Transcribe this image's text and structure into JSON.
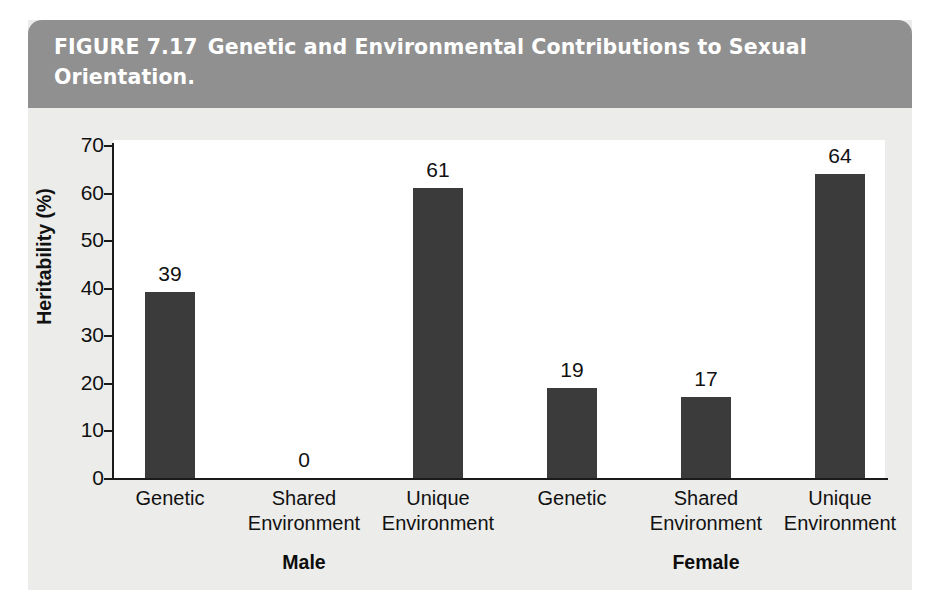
{
  "figure": {
    "number": "FIGURE 7.17",
    "caption": "Genetic and Environmental Contributions to Sexual Orientation.",
    "banner_color": "#909090",
    "panel_color": "#ececea",
    "bar_color": "#3b3b3b"
  },
  "chart_data": {
    "type": "bar",
    "xlabel": "",
    "ylabel": "Heritability (%)",
    "ylim": [
      0,
      70
    ],
    "yticks": [
      0,
      10,
      20,
      30,
      40,
      50,
      60,
      70
    ],
    "ytick_labels": [
      "0",
      "10",
      "20",
      "30",
      "40",
      "50",
      "60",
      "70"
    ],
    "grid": false,
    "legend": "none",
    "categories": [
      "Genetic",
      "Shared\nEnvironment",
      "Unique\nEnvironment",
      "Genetic",
      "Shared\nEnvironment",
      "Unique\nEnvironment"
    ],
    "values": [
      39,
      0,
      61,
      19,
      17,
      64
    ],
    "value_labels": [
      "39",
      "0",
      "61",
      "19",
      "17",
      "64"
    ],
    "groups": [
      {
        "label": "Male",
        "category_indices": [
          0,
          1,
          2
        ]
      },
      {
        "label": "Female",
        "category_indices": [
          3,
          4,
          5
        ]
      }
    ],
    "annotations": []
  },
  "bars": [
    {
      "label": "Genetic",
      "group": "Male",
      "value": 39,
      "value_text": "39",
      "x": 145,
      "width": 50
    },
    {
      "label": "Shared Environment",
      "group": "Male",
      "value": 0,
      "value_text": "0",
      "x": 279,
      "width": 50
    },
    {
      "label": "Unique Environment",
      "group": "Male",
      "value": 61,
      "value_text": "61",
      "x": 413,
      "width": 50
    },
    {
      "label": "Genetic",
      "group": "Female",
      "value": 19,
      "value_text": "19",
      "x": 547,
      "width": 50
    },
    {
      "label": "Shared Environment",
      "group": "Female",
      "value": 17,
      "value_text": "17",
      "x": 681,
      "width": 50
    },
    {
      "label": "Unique Environment",
      "group": "Female",
      "value": 64,
      "value_text": "64",
      "x": 815,
      "width": 50
    }
  ],
  "axis": {
    "y_title": "Heritability (%)",
    "ticks": [
      {
        "value": 70,
        "label": "70"
      },
      {
        "value": 60,
        "label": "60"
      },
      {
        "value": 50,
        "label": "50"
      },
      {
        "value": 40,
        "label": "40"
      },
      {
        "value": 30,
        "label": "30"
      },
      {
        "value": 20,
        "label": "20"
      },
      {
        "value": 10,
        "label": "10"
      },
      {
        "value": 0,
        "label": "0"
      }
    ]
  },
  "categories": [
    {
      "line1": "Genetic",
      "line2": "",
      "center": 170
    },
    {
      "line1": "Shared",
      "line2": "Environment",
      "center": 304
    },
    {
      "line1": "Unique",
      "line2": "Environment",
      "center": 438
    },
    {
      "line1": "Genetic",
      "line2": "",
      "center": 572
    },
    {
      "line1": "Shared",
      "line2": "Environment",
      "center": 706
    },
    {
      "line1": "Unique",
      "line2": "Environment",
      "center": 840
    }
  ],
  "groups": [
    {
      "label": "Male",
      "center": 304
    },
    {
      "label": "Female",
      "center": 706
    }
  ]
}
